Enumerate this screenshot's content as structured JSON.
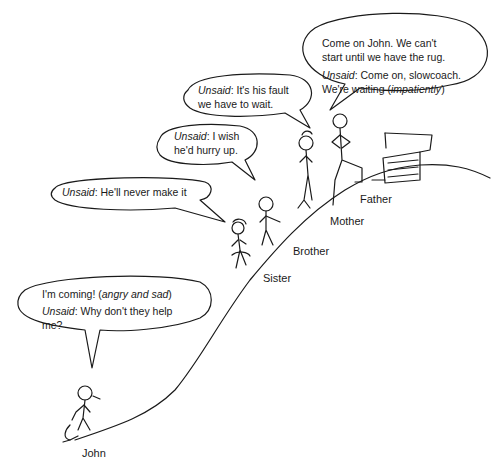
{
  "figure": {
    "characters": [
      {
        "name": "John",
        "label": "John"
      },
      {
        "name": "Sister",
        "label": "Sister"
      },
      {
        "name": "Brother",
        "label": "Brother"
      },
      {
        "name": "Mother",
        "label": "Mother"
      },
      {
        "name": "Father",
        "label": "Father"
      }
    ],
    "bubbles": {
      "father": {
        "line1": "Come on John. We can't",
        "line2": "start until we have the rug.",
        "line3_prefix": "Unsaid",
        "line3_rest": ": Come on, slowcoach.",
        "line4_a": "We're waiting (",
        "line4_italic": "impatiently",
        "line4_b": ")"
      },
      "mother": {
        "prefix": "Unsaid",
        "line1_rest": ": It's his fault",
        "line2": "we have to wait."
      },
      "brother": {
        "prefix": "Unsaid",
        "line1_rest": ": I wish",
        "line2": "he'd hurry up."
      },
      "sister": {
        "prefix": "Unsaid",
        "line1_rest": ": He'll never make it"
      },
      "john": {
        "line1_a": "I'm coming! (",
        "line1_italic": "angry and sad",
        "line1_b": ")",
        "line2_prefix": "Unsaid",
        "line2_rest": ": Why don't they help",
        "line3": "me?"
      }
    }
  }
}
